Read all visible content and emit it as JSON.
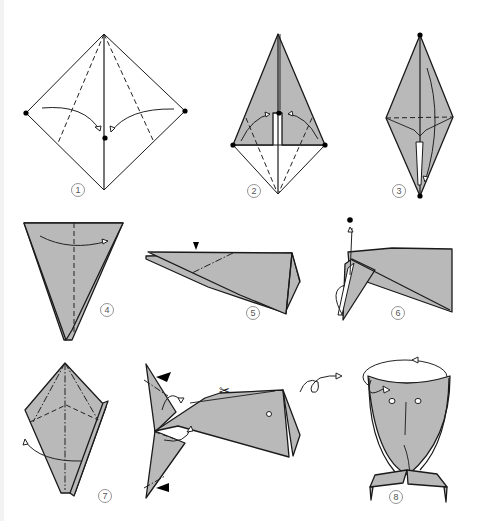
{
  "diagram": {
    "paper_color": "#b9b9b9",
    "line_color": "#1a1a1a",
    "background": "#ffffff",
    "steps": [
      {
        "number": "1",
        "description": "Square with diagonal; fold left and right corners to center along valley lines"
      },
      {
        "number": "2",
        "description": "Kite shape; fold lower edges to the center crease"
      },
      {
        "number": "3",
        "description": "Diamond with horizontal valley fold; fold in half"
      },
      {
        "number": "4",
        "description": "Inverted triangle; fold in half along center line"
      },
      {
        "number": "5",
        "description": "Side view; inside-reverse fold at the marked point"
      },
      {
        "number": "6",
        "description": "Pull the tail up to the dot"
      },
      {
        "number": "7",
        "description": "Mountain and valley folds to shape the tail"
      },
      {
        "number": "8",
        "description": "Finished whale, front view"
      }
    ],
    "intermediate": {
      "description": "Whale side view: cut marked with scissors, reverse-fold tail flukes, turn over"
    },
    "symbols": {
      "scissors": "✂",
      "push_mark": "▼",
      "turn_over": "loop-arrow"
    }
  }
}
